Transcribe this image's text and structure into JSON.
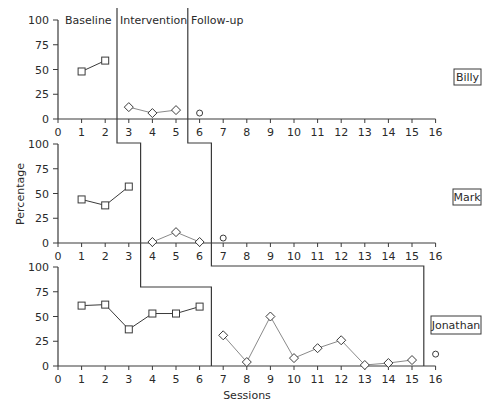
{
  "chart_data": {
    "type": "line",
    "title": "",
    "xlabel": "Sessions",
    "ylabel": "Percentage",
    "xlim": [
      0,
      16
    ],
    "ylim": [
      0,
      100
    ],
    "x_ticks": [
      0,
      1,
      2,
      3,
      4,
      5,
      6,
      7,
      8,
      9,
      10,
      11,
      12,
      13,
      14,
      15,
      16
    ],
    "y_ticks": [
      0,
      25,
      50,
      75,
      100
    ],
    "grid": false,
    "phase_labels": [
      "Baseline",
      "Intervention",
      "Follow-up"
    ],
    "marker_legend": {
      "Baseline": "square",
      "Intervention": "diamond",
      "Follow-up": "circle"
    },
    "panels": [
      {
        "participant": "Billy",
        "series": [
          {
            "name": "Baseline",
            "marker": "square",
            "x": [
              1,
              2
            ],
            "values": [
              48,
              59
            ]
          },
          {
            "name": "Intervention",
            "marker": "diamond",
            "x": [
              3,
              4,
              5
            ],
            "values": [
              12,
              6,
              9
            ]
          },
          {
            "name": "Follow-up",
            "marker": "circle",
            "x": [
              6
            ],
            "values": [
              6
            ]
          }
        ],
        "phase_changes": [
          2.5,
          5.5
        ]
      },
      {
        "participant": "Mark",
        "series": [
          {
            "name": "Baseline",
            "marker": "square",
            "x": [
              1,
              2,
              3
            ],
            "values": [
              44,
              38,
              57
            ]
          },
          {
            "name": "Intervention",
            "marker": "diamond",
            "x": [
              4,
              5,
              6
            ],
            "values": [
              1,
              11,
              1
            ]
          },
          {
            "name": "Follow-up",
            "marker": "circle",
            "x": [
              7
            ],
            "values": [
              5
            ]
          }
        ],
        "phase_changes": [
          3.5,
          6.5
        ]
      },
      {
        "participant": "Jonathan",
        "series": [
          {
            "name": "Baseline",
            "marker": "square",
            "x": [
              1,
              2,
              3,
              4,
              5,
              6
            ],
            "values": [
              61,
              62,
              37,
              53,
              53,
              60
            ]
          },
          {
            "name": "Intervention",
            "marker": "diamond",
            "x": [
              7,
              8,
              9,
              10,
              11,
              12,
              13,
              14,
              15
            ],
            "values": [
              31,
              4,
              50,
              8,
              18,
              26,
              1,
              3,
              6
            ]
          },
          {
            "name": "Follow-up",
            "marker": "circle",
            "x": [
              16
            ],
            "values": [
              12
            ]
          }
        ],
        "phase_changes": [
          6.5,
          15.5
        ]
      }
    ]
  }
}
